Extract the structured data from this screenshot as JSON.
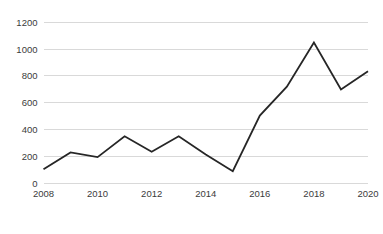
{
  "chart_data": {
    "type": "line",
    "title": "",
    "subtitle": "",
    "xlabel": "",
    "ylabel": "",
    "x": [
      2008,
      2009,
      2010,
      2011,
      2012,
      2013,
      2014,
      2015,
      2016,
      2017,
      2018,
      2019,
      2020
    ],
    "values": [
      105,
      230,
      195,
      350,
      235,
      350,
      215,
      90,
      505,
      720,
      1050,
      700,
      835
    ],
    "series": [
      {
        "name": "",
        "values": [
          105,
          230,
          195,
          350,
          235,
          350,
          215,
          90,
          505,
          720,
          1050,
          700,
          835
        ]
      }
    ],
    "xlim": [
      2008,
      2020
    ],
    "ylim": [
      0,
      1200
    ],
    "y_ticks": [
      0,
      200,
      400,
      600,
      800,
      1000,
      1200
    ],
    "y_tick_labels": [
      "0",
      "200",
      "400",
      "600",
      "800",
      "1000",
      "1200"
    ],
    "x_ticks": [
      2008,
      2010,
      2012,
      2014,
      2016,
      2018,
      2020
    ],
    "x_tick_labels": [
      "2008",
      "2010",
      "2012",
      "2014",
      "2016",
      "2018",
      "2020"
    ],
    "grid": "horizontal",
    "legend": "none",
    "markers": "none",
    "annotations": [],
    "colors": {
      "line": "#262626",
      "gridline": "#d9d9d9",
      "tick_text": "#3b3b3b",
      "background": "#ffffff"
    },
    "line_width": 1.8
  }
}
